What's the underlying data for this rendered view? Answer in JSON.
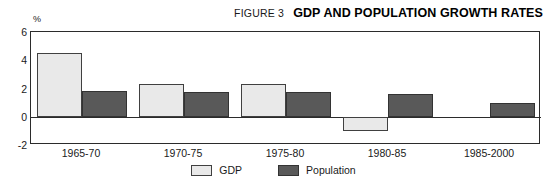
{
  "header": {
    "figure_label": "FIGURE 3",
    "title": "GDP AND POPULATION GROWTH RATES"
  },
  "chart_data": {
    "type": "bar",
    "title": "GDP AND POPULATION GROWTH RATES",
    "subtitle": "FIGURE 3",
    "xlabel": "",
    "ylabel": "%",
    "unit": "%",
    "grid": false,
    "legend_position": "bottom-center",
    "ylim": [
      -2,
      6
    ],
    "yticks": [
      6,
      4,
      2,
      0,
      -2
    ],
    "ytick_labels": [
      "6",
      "4",
      "2",
      "0",
      "-2"
    ],
    "categories": [
      "1965-70",
      "1970-75",
      "1975-80",
      "1980-85",
      "1985-2000"
    ],
    "series": [
      {
        "name": "GDP",
        "color": "#e9e9e9",
        "values": [
          4.5,
          2.3,
          2.3,
          -1.0,
          null
        ]
      },
      {
        "name": "Population",
        "color": "#595959",
        "values": [
          1.8,
          1.75,
          1.75,
          1.6,
          1.0
        ]
      }
    ]
  },
  "legend": {
    "items": [
      {
        "label": "GDP",
        "color": "#e9e9e9"
      },
      {
        "label": "Population",
        "color": "#595959"
      }
    ]
  }
}
